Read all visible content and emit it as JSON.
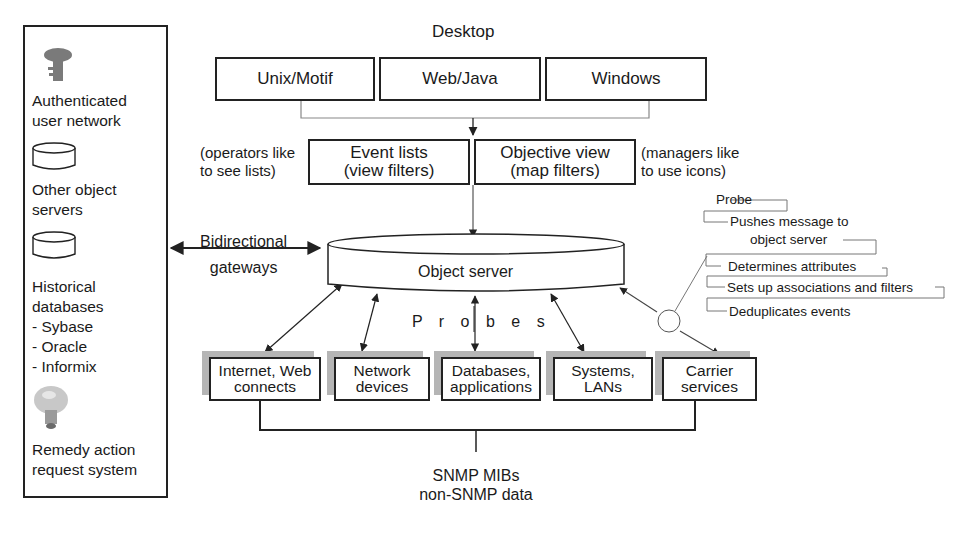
{
  "desktop": {
    "title": "Desktop",
    "clients": [
      {
        "label": "Unix/Motif"
      },
      {
        "label": "Web/Java"
      },
      {
        "label": "Windows"
      }
    ]
  },
  "views": {
    "event_lists": {
      "line1": "Event lists",
      "line2": "(view filters)"
    },
    "objective_view": {
      "line1": "Objective view",
      "line2": "(map filters)"
    },
    "left_note": {
      "line1": "(operators like",
      "line2": "to see lists)"
    },
    "right_note": {
      "line1": "(managers like",
      "line2": "to use icons)"
    }
  },
  "object_server": {
    "label": "Object server"
  },
  "gateways": {
    "line1": "Bidirectional",
    "line2": "gateways"
  },
  "probes_label": "P r o b e s",
  "probe_callouts": [
    {
      "label": "Probe"
    },
    {
      "label": "Pushes message to"
    },
    {
      "label": "object server"
    },
    {
      "label": "Determines attributes"
    },
    {
      "label": "Sets up associations and filters"
    },
    {
      "label": "Deduplicates events"
    }
  ],
  "sources": [
    {
      "line1": "Internet, Web",
      "line2": "connects"
    },
    {
      "line1": "Network",
      "line2": "devices"
    },
    {
      "line1": "Databases,",
      "line2": "applications"
    },
    {
      "line1": "Systems,",
      "line2": "LANs"
    },
    {
      "line1": "Carrier",
      "line2": "services"
    }
  ],
  "data_sources": {
    "line1": "SNMP MIBs",
    "line2": "non-SNMP data"
  },
  "side_panel": {
    "items": [
      {
        "icon": "key-icon",
        "line1": "Authenticated",
        "line2": "user network"
      },
      {
        "icon": "database-icon",
        "line1": "Other object",
        "line2": "servers"
      },
      {
        "icon": "database-icon",
        "line1": "Historical",
        "line2": "databases",
        "subitems": [
          "- Sybase",
          "- Oracle",
          "- Informix"
        ]
      },
      {
        "icon": "lightbulb-icon",
        "line1": "Remedy action",
        "line2": "request system"
      }
    ]
  }
}
